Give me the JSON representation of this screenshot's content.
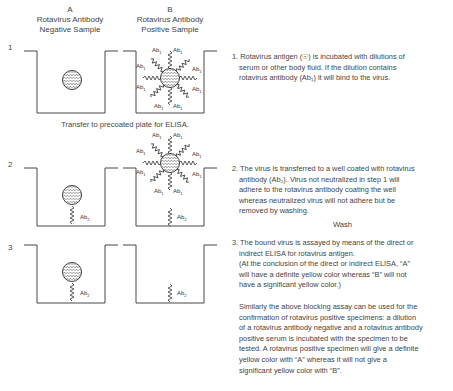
{
  "columns": {
    "a": {
      "letter": "A",
      "line1": "Rotavirus Antibody",
      "line2": "Negative Sample"
    },
    "b": {
      "letter": "B",
      "line1": "Rotavirus Antibody",
      "line2": "Positive Sample"
    }
  },
  "steps": [
    {
      "number": "1",
      "description_lines": [
        "1. Rotavirus antigen (☉) is incubated with dilutions of",
        "serum or other body fluid. If the dilution contains",
        "rotavirus antibody (Ab₁) it will bind to the virus."
      ]
    },
    {
      "number": "2",
      "description_lines": [
        "2. The virus is transferred to a well coated with rotavirus",
        "antibody (Ab₂). Virus not neutralized in step 1 will",
        "adhere to the rotavirus antibody coating the well",
        "whereas neutralized virus will not adhere but be",
        "removed by washing."
      ]
    },
    {
      "number": "3",
      "description_lines": [
        "3. The bound virus is assayed by means of the direct or",
        "indirect ELISA for rotavirus antigen.",
        "(At the conclusion of the direct or indirect ELISA, “A”",
        "will have a definite yellow color whereas “B” will not",
        "have a significant yellow color.)"
      ]
    }
  ],
  "transfer_note": "Transfer to precoated plate for ELISA.",
  "wash_note": "Wash",
  "summary_lines": [
    "Similarly the above blocking assay can be used for the",
    "confirmation of rotavirus positive specimens: a dilution",
    "of a rotavirus antibody negative and a rotavirus antibody",
    "positive serum is incubated with the specimen to be",
    "tested. A rotavirus positive specimen will give a definite",
    "yellow color with “A” whereas it will not give a",
    "significant yellow color with “B”."
  ],
  "labels": {
    "ab1": "Ab",
    "ab1_sub": "1",
    "ab2": "Ab",
    "ab2_sub": "2"
  }
}
